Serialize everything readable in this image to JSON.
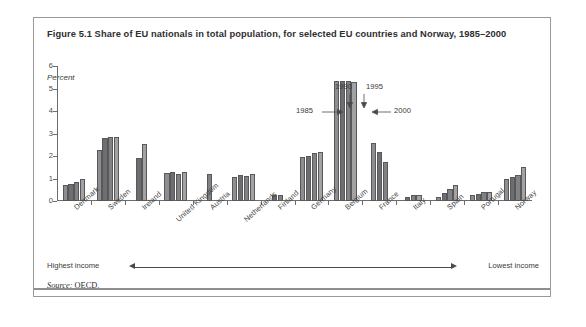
{
  "figure": {
    "title": "Figure 5.1  Share of EU nationals in total population, for selected EU countries and Norway, 1985–2000",
    "source_label": "Source:",
    "source_value": " OECD."
  },
  "axis": {
    "unit_label": "Percent",
    "y_ticks": [
      "0",
      "1",
      "2",
      "3",
      "4",
      "5",
      "6"
    ]
  },
  "annotations": {
    "year_1985": "1985",
    "year_1990": "1990",
    "year_1995": "1995",
    "year_2000": "2000",
    "highest_income": "Highest income",
    "lowest_income": "Lowest income"
  },
  "chart_data": {
    "type": "bar",
    "title": "Figure 5.1  Share of EU nationals in total population, for selected EU countries and Norway, 1985–2000",
    "xlabel": "",
    "ylabel": "Percent",
    "ylim": [
      0,
      6
    ],
    "ytick_step": 1,
    "grid": false,
    "legend_position": "none",
    "series_names": [
      "1985",
      "1990",
      "1995",
      "2000"
    ],
    "categories": [
      "Denmark",
      "Sweden",
      "Ireland",
      "United Kingdom",
      "Austria",
      "Netherlands",
      "Finland",
      "Germany",
      "Belgium",
      "France",
      "Italy",
      "Spain",
      "Portugal",
      "Norway"
    ],
    "series": [
      {
        "name": "1985",
        "values": [
          0.7,
          2.25,
          null,
          1.25,
          null,
          1.05,
          null,
          1.95,
          5.35,
          2.6,
          null,
          0.2,
          0.25,
          1.0
        ]
      },
      {
        "name": "1990",
        "values": [
          0.75,
          2.8,
          1.9,
          1.3,
          null,
          1.15,
          0.25,
          2.0,
          5.35,
          2.2,
          0.2,
          0.35,
          0.3,
          1.05
        ]
      },
      {
        "name": "1995",
        "values": [
          0.85,
          2.85,
          null,
          1.2,
          1.2,
          1.1,
          0.25,
          2.15,
          5.35,
          1.75,
          0.25,
          0.55,
          0.4,
          1.15
        ]
      },
      {
        "name": "2000",
        "values": [
          1.0,
          2.85,
          2.55,
          1.3,
          null,
          1.2,
          null,
          2.2,
          5.3,
          null,
          0.25,
          0.7,
          0.4,
          1.5
        ]
      }
    ],
    "income_scale": {
      "left_label": "Highest income",
      "right_label": "Lowest income",
      "direction": "left-to-right"
    }
  }
}
